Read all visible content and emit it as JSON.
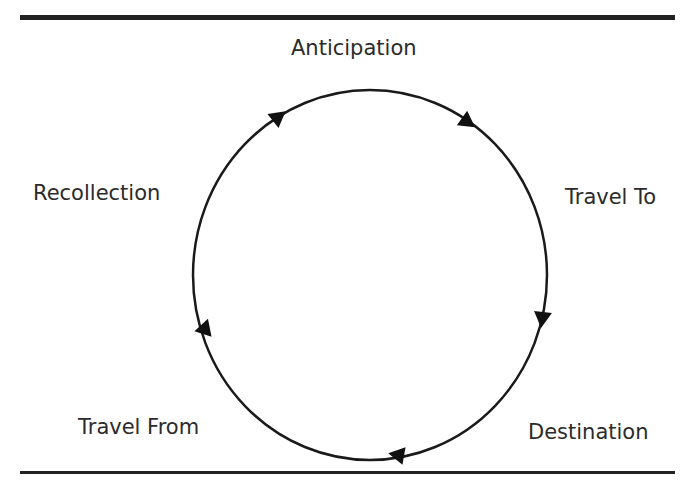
{
  "diagram": {
    "type": "cycle",
    "stages": [
      {
        "id": "anticipation",
        "label": "Anticipation"
      },
      {
        "id": "travel-to",
        "label": "Travel To"
      },
      {
        "id": "destination",
        "label": "Destination"
      },
      {
        "id": "travel-from",
        "label": "Travel From"
      },
      {
        "id": "recollection",
        "label": "Recollection"
      }
    ],
    "direction": "clockwise",
    "line_color": "#1a1a1a"
  }
}
